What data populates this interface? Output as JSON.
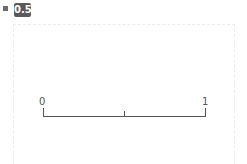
{
  "badge": {
    "value": "0.5"
  },
  "slider_axis": {
    "min_label": "0",
    "max_label": "1",
    "ticks": [
      0,
      0.5,
      1
    ]
  },
  "colors": {
    "badge_bg": "#5a5a5a",
    "badge_text": "#ffffff",
    "axis": "#555555",
    "border": "#ececec"
  }
}
